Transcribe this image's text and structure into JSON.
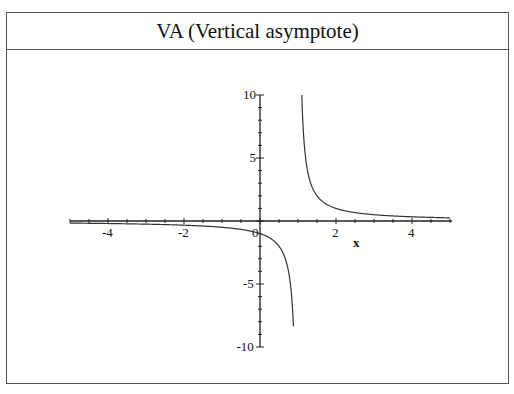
{
  "page": {
    "title": "VA (Vertical asymptote)"
  },
  "chart_data": {
    "type": "line",
    "title": "VA (Vertical asymptote)",
    "xlabel": "x",
    "ylabel": "",
    "function": "y = 1/(x-1)",
    "xlim": [
      -5,
      5
    ],
    "ylim": [
      -10,
      10
    ],
    "x_ticks": [
      -4,
      -2,
      0,
      2,
      4
    ],
    "y_ticks": [
      -10,
      -5,
      5,
      10
    ],
    "vertical_asymptote": 1,
    "horizontal_asymptote": 0,
    "grid": false,
    "series": [
      {
        "name": "y = 1/(x-1)",
        "x": [
          -5,
          -4,
          -3,
          -2,
          -1,
          0,
          0.5,
          0.8,
          0.9,
          1.1,
          1.2,
          1.5,
          2,
          3,
          4,
          5
        ],
        "values": [
          -0.167,
          -0.2,
          -0.25,
          -0.333,
          -0.5,
          -1,
          -2,
          -5,
          -10,
          10,
          5,
          2,
          1,
          0.5,
          0.333,
          0.25
        ]
      }
    ]
  }
}
